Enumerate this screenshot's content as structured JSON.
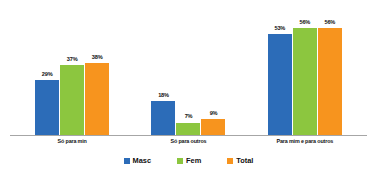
{
  "chart_data": {
    "type": "bar",
    "title": "",
    "subtitle": "",
    "xlabel": "",
    "ylabel": "",
    "ylim": [
      0,
      65
    ],
    "grid": false,
    "legend_position": "bottom",
    "value_suffix": "%",
    "categories": [
      "Só para min",
      "Só para outros",
      "Para mim e para outros"
    ],
    "series": [
      {
        "name": "Masc",
        "color": "#2C6CB8",
        "values": [
          29,
          18,
          53
        ],
        "labels": [
          "29%",
          "18%",
          "53%"
        ]
      },
      {
        "name": "Fem",
        "color": "#8CC63F",
        "values": [
          37,
          7,
          56
        ],
        "labels": [
          "37%",
          "7%",
          "56%"
        ]
      },
      {
        "name": "Total",
        "color": "#F7941E",
        "values": [
          38,
          9,
          56
        ],
        "labels": [
          "38%",
          "9%",
          "56%"
        ]
      }
    ],
    "axis_color": "#A6A6A6"
  }
}
